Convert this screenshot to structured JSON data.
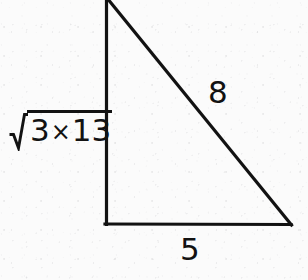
{
  "figure": {
    "kind": "right-triangle",
    "stroke_color": "#121212",
    "background_color": "#fbfbfb",
    "stroke_width_px": 3,
    "vertices": {
      "apex_top": [
        107,
        0
      ],
      "right_angle_bottom_left": [
        106,
        224
      ],
      "bottom_right": [
        291,
        225
      ]
    },
    "sides": [
      {
        "name": "vertical-leg",
        "from": "apex_top",
        "to": "right_angle_bottom_left"
      },
      {
        "name": "base-leg",
        "from": "right_angle_bottom_left",
        "to": "bottom_right"
      },
      {
        "name": "hypotenuse",
        "from": "apex_top",
        "to": "bottom_right"
      }
    ]
  },
  "labels": {
    "vertical_leg": {
      "full_text": "√(3×13)",
      "radical_symbol": "√",
      "radicand_left": "3",
      "radicand_operator": "×",
      "radicand_right": "13"
    },
    "hypotenuse": "8",
    "base": "5"
  }
}
